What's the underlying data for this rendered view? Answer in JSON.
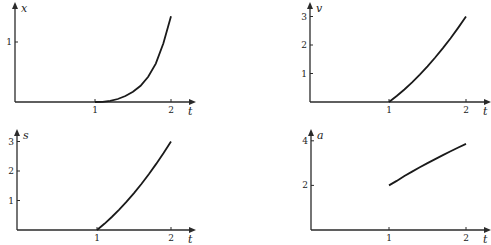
{
  "chart_data": [
    {
      "type": "line",
      "title": "",
      "xlabel": "t",
      "ylabel": "x",
      "xlim": [
        0,
        2.2
      ],
      "ylim": [
        0,
        1.55
      ],
      "xticks": [
        1,
        2
      ],
      "yticks": [
        1
      ],
      "grid": false,
      "series": [
        {
          "name": "x(t)",
          "x": [
            0,
            0.5,
            1.0,
            1.1,
            1.2,
            1.3,
            1.4,
            1.5,
            1.6,
            1.7,
            1.8,
            1.9,
            2.0
          ],
          "values": [
            0,
            0,
            0,
            0.003,
            0.018,
            0.05,
            0.1,
            0.17,
            0.27,
            0.42,
            0.64,
            0.98,
            1.43
          ]
        }
      ]
    },
    {
      "type": "line",
      "title": "",
      "xlabel": "t",
      "ylabel": "v",
      "xlim": [
        0,
        2.2
      ],
      "ylim": [
        0,
        3.4
      ],
      "xticks": [
        1,
        2
      ],
      "yticks": [
        1,
        2,
        3
      ],
      "grid": false,
      "series": [
        {
          "name": "v(t)",
          "x": [
            0,
            0.5,
            1.0,
            1.1,
            1.2,
            1.3,
            1.4,
            1.5,
            1.6,
            1.7,
            1.8,
            1.9,
            2.0
          ],
          "values": [
            0,
            0,
            0,
            0.21,
            0.44,
            0.69,
            0.96,
            1.25,
            1.56,
            1.89,
            2.24,
            2.61,
            3.0
          ]
        }
      ]
    },
    {
      "type": "line",
      "title": "",
      "xlabel": "t",
      "ylabel": "s",
      "xlim": [
        0,
        2.2
      ],
      "ylim": [
        0,
        3.4
      ],
      "xticks": [
        1,
        2
      ],
      "yticks": [
        1,
        2,
        3
      ],
      "grid": false,
      "series": [
        {
          "name": "s(t)",
          "x": [
            1.0,
            1.1,
            1.2,
            1.3,
            1.4,
            1.5,
            1.6,
            1.7,
            1.8,
            1.9,
            2.0
          ],
          "values": [
            0,
            0.21,
            0.44,
            0.69,
            0.96,
            1.25,
            1.56,
            1.89,
            2.24,
            2.61,
            3.0
          ]
        }
      ]
    },
    {
      "type": "line",
      "title": "",
      "xlabel": "t",
      "ylabel": "a",
      "xlim": [
        0,
        2.2
      ],
      "ylim": [
        0,
        4.3
      ],
      "xticks": [
        1,
        2
      ],
      "yticks": [
        2,
        4
      ],
      "grid": false,
      "series": [
        {
          "name": "a(t)",
          "x": [
            1.0,
            1.1,
            1.2,
            1.3,
            1.4,
            1.5,
            1.6,
            1.7,
            1.8,
            1.9,
            2.0
          ],
          "values": [
            2.0,
            2.2,
            2.42,
            2.62,
            2.81,
            3.0,
            3.18,
            3.36,
            3.53,
            3.7,
            3.86
          ]
        }
      ]
    }
  ]
}
